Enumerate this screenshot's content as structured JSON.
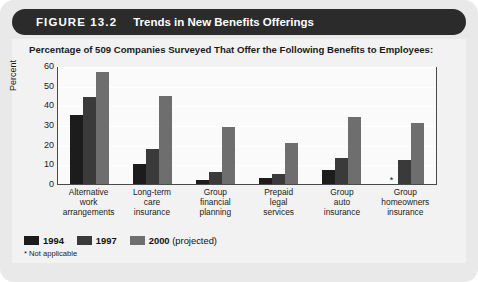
{
  "figure": {
    "number": "FIGURE 13.2",
    "title": "Trends in New Benefits Offerings"
  },
  "subtitle": "Percentage of 509 Companies Surveyed That Offer the Following Benefits to Employees:",
  "footnote": "* Not applicable",
  "na_marker": "*",
  "colors": {
    "header_bar": "#2b2b2b",
    "card_background": "#e9e9e9",
    "panel_background": "#f2f2f2",
    "plot_background": "#fafafa",
    "series_1994": "#1c1c1c",
    "series_1997": "#3a3a3a",
    "series_2000": "#6e6e6e",
    "gridline": "#ffffff",
    "axis": "#4a4a4a"
  },
  "legend": [
    {
      "label": "1994",
      "color": "#1c1c1c",
      "note": ""
    },
    {
      "label": "1997",
      "color": "#3a3a3a",
      "note": ""
    },
    {
      "label": "2000",
      "color": "#6e6e6e",
      "note": " (projected)"
    }
  ],
  "chart_data": {
    "type": "bar",
    "title": "Trends in New Benefits Offerings",
    "subtitle": "Percentage of 509 Companies Surveyed That Offer the Following Benefits to Employees:",
    "xlabel": "",
    "ylabel": "Percent",
    "ylim": [
      0,
      60
    ],
    "yticks": [
      0,
      10,
      20,
      30,
      40,
      50,
      60
    ],
    "ytick_labels": [
      "0",
      "10",
      "20",
      "30",
      "40",
      "50",
      "60"
    ],
    "grid": true,
    "legend_position": "below-left",
    "categories": [
      "Alternative work arrangements",
      "Long-term care insurance",
      "Group financial planning",
      "Prepaid legal services",
      "Group auto insurance",
      "Group homeowners insurance"
    ],
    "category_lines": [
      [
        "Alternative",
        "work",
        "arrangements"
      ],
      [
        "Long-term",
        "care",
        "insurance"
      ],
      [
        "Group",
        "financial",
        "planning"
      ],
      [
        "Prepaid",
        "legal",
        "services"
      ],
      [
        "Group",
        "auto",
        "insurance"
      ],
      [
        "Group",
        "homeowners",
        "insurance"
      ]
    ],
    "series": [
      {
        "name": "1994",
        "color": "#1c1c1c",
        "values": [
          35,
          10,
          2,
          3,
          7,
          null
        ]
      },
      {
        "name": "1997",
        "color": "#3a3a3a",
        "values": [
          44,
          18,
          6,
          5,
          13,
          12
        ]
      },
      {
        "name": "2000 (projected)",
        "color": "#6e6e6e",
        "values": [
          57,
          45,
          29,
          21,
          34,
          31
        ]
      }
    ],
    "annotations": [
      {
        "category": "Group homeowners insurance",
        "series": "1994",
        "text": "*",
        "meaning": "Not applicable"
      }
    ]
  }
}
